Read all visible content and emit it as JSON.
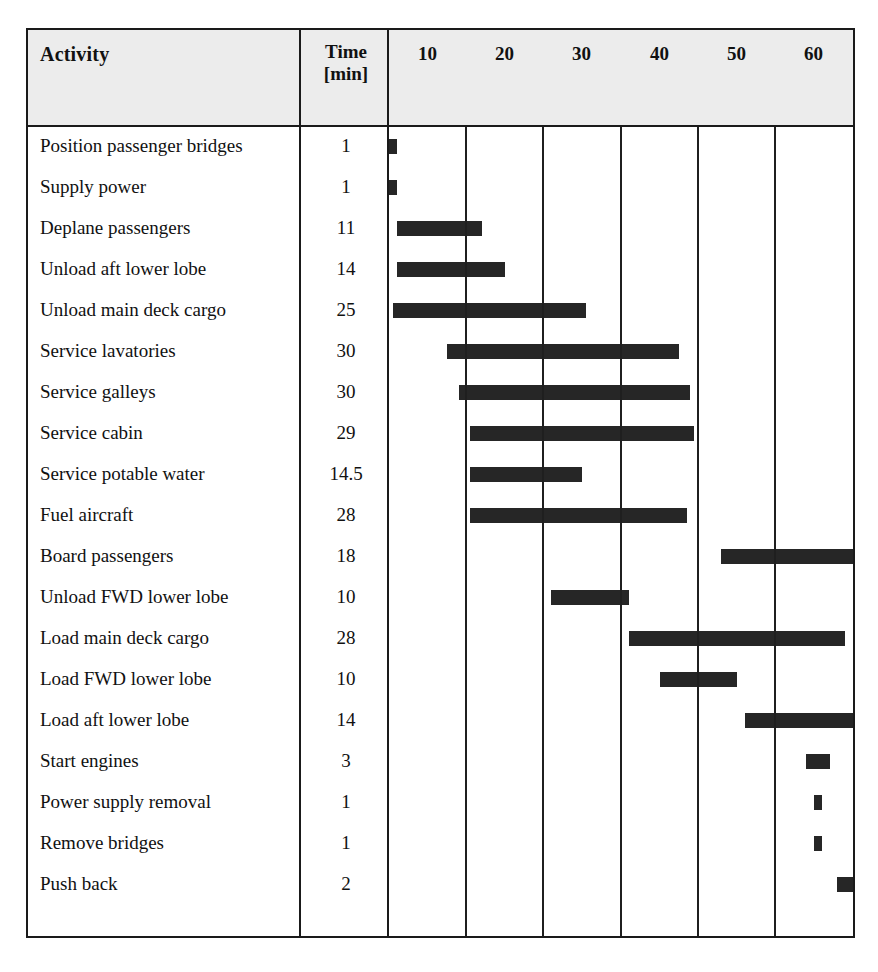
{
  "chart_data": {
    "type": "bar",
    "subtype": "gantt",
    "title": "",
    "xlabel": "",
    "ylabel": "",
    "xlim": [
      0,
      60
    ],
    "grid": true,
    "columns": [
      "Activity",
      "Time [min]"
    ],
    "header": {
      "activity": "Activity",
      "time_line1": "Time",
      "time_line2": "[min]"
    },
    "axis_ticks": [
      "10",
      "20",
      "30",
      "40",
      "50",
      "60"
    ],
    "axis_tick_values": [
      10,
      20,
      30,
      40,
      50,
      60
    ],
    "bar_color": "#262626",
    "header_background": "#ececec",
    "border_color": "#1a1a1a",
    "categories": [
      "Position passenger bridges",
      "Supply power",
      "Deplane passengers",
      "Unload aft lower lobe",
      "Unload main deck cargo",
      "Service lavatories",
      "Service galleys",
      "Service cabin",
      "Service potable water",
      "Fuel aircraft",
      "Board passengers",
      "Unload FWD lower lobe",
      "Load main deck cargo",
      "Load FWD lower lobe",
      "Load aft lower lobe",
      "Start engines",
      "Power supply removal",
      "Remove bridges",
      "Push back"
    ],
    "durations": [
      1,
      1,
      11,
      14,
      25,
      30,
      30,
      29,
      14.5,
      28,
      18,
      10,
      28,
      10,
      14,
      3,
      1,
      1,
      2
    ],
    "rows": [
      {
        "activity": "Position passenger bridges",
        "duration": "1",
        "start": 0,
        "end": 1
      },
      {
        "activity": "Supply power",
        "duration": "1",
        "start": 0,
        "end": 1
      },
      {
        "activity": "Deplane passengers",
        "duration": "11",
        "start": 1,
        "end": 12
      },
      {
        "activity": "Unload aft lower lobe",
        "duration": "14",
        "start": 1,
        "end": 15
      },
      {
        "activity": "Unload main deck cargo",
        "duration": "25",
        "start": 0.5,
        "end": 25.5
      },
      {
        "activity": "Service lavatories",
        "duration": "30",
        "start": 7.5,
        "end": 37.5
      },
      {
        "activity": "Service galleys",
        "duration": "30",
        "start": 9,
        "end": 39
      },
      {
        "activity": "Service cabin",
        "duration": "29",
        "start": 10.5,
        "end": 39.5
      },
      {
        "activity": "Service potable water",
        "duration": "14.5",
        "start": 10.5,
        "end": 25
      },
      {
        "activity": "Fuel aircraft",
        "duration": "28",
        "start": 10.5,
        "end": 38.5
      },
      {
        "activity": "Board passengers",
        "duration": "18",
        "start": 43,
        "end": 61
      },
      {
        "activity": "Unload FWD lower lobe",
        "duration": "10",
        "start": 21,
        "end": 31
      },
      {
        "activity": "Load main deck cargo",
        "duration": "28",
        "start": 31,
        "end": 59
      },
      {
        "activity": "Load FWD lower lobe",
        "duration": "10",
        "start": 35,
        "end": 45
      },
      {
        "activity": "Load aft lower lobe",
        "duration": "14",
        "start": 46,
        "end": 60
      },
      {
        "activity": "Start engines",
        "duration": "3",
        "start": 54,
        "end": 57
      },
      {
        "activity": "Power supply removal",
        "duration": "1",
        "start": 55,
        "end": 56
      },
      {
        "activity": "Remove bridges",
        "duration": "1",
        "start": 55,
        "end": 56
      },
      {
        "activity": "Push back",
        "duration": "2",
        "start": 58,
        "end": 60
      }
    ]
  }
}
